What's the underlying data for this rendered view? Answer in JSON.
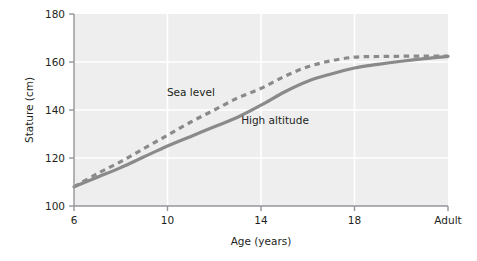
{
  "chart_data": {
    "type": "line",
    "title": "",
    "xlabel": "Age (years)",
    "ylabel": "Stature (cm)",
    "x_tick_labels": [
      "6",
      "10",
      "14",
      "18",
      "Adult"
    ],
    "x_tick_values": [
      6,
      10,
      14,
      18,
      22
    ],
    "y_tick_labels": [
      "100",
      "120",
      "140",
      "160",
      "180"
    ],
    "y_tick_values": [
      100,
      120,
      140,
      160,
      180
    ],
    "xlim": [
      6,
      22
    ],
    "ylim": [
      100,
      180
    ],
    "grid": true,
    "grid_color": "#ffffff",
    "plot_background": "#eeeeee",
    "axis_color": "#939598",
    "legend": "inline-labels",
    "series": [
      {
        "name": "Sea level",
        "style": "dashed",
        "color": "#8a8a8a",
        "label_x": 11.0,
        "label_y": 146.0,
        "x": [
          6,
          7,
          8,
          9,
          10,
          11,
          12,
          13,
          14,
          15,
          16,
          17,
          18,
          19,
          20,
          21,
          22
        ],
        "y": [
          108.0,
          113.5,
          118.5,
          124.0,
          129.5,
          135.0,
          140.0,
          145.0,
          149.0,
          154.0,
          158.0,
          160.5,
          162.0,
          162.3,
          162.4,
          162.5,
          162.5
        ]
      },
      {
        "name": "High altitude",
        "style": "solid",
        "color": "#8a8a8a",
        "label_x": 14.6,
        "label_y": 134.0,
        "x": [
          6,
          7,
          8,
          9,
          10,
          11,
          12,
          13,
          14,
          15,
          16,
          17,
          18,
          19,
          20,
          21,
          22
        ],
        "y": [
          108.0,
          112.0,
          116.0,
          120.5,
          125.0,
          129.0,
          133.0,
          137.0,
          142.0,
          147.5,
          152.0,
          155.0,
          157.5,
          159.0,
          160.3,
          161.4,
          162.3
        ]
      }
    ]
  }
}
